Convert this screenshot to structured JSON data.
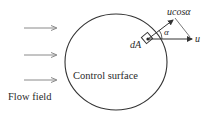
{
  "diagram": {
    "labels": {
      "flow_field": "Flow field",
      "control_surface": "Control surface",
      "area_element": "dA",
      "velocity": "u",
      "normal_component": "ucosα",
      "angle": "α"
    },
    "colors": {
      "stroke": "#333333",
      "text": "#2a2a2a",
      "flow_arrow": "#8a8a8a"
    }
  }
}
